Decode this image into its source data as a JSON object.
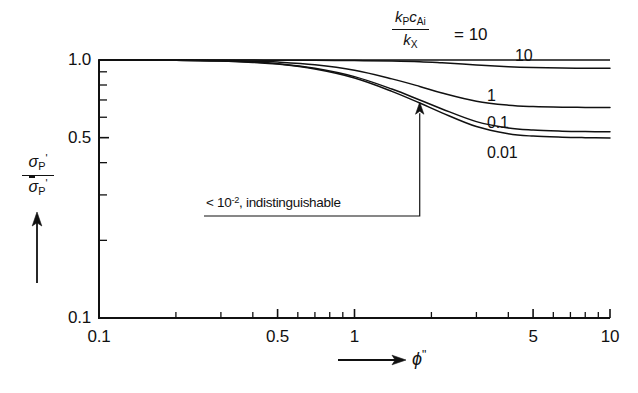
{
  "figure": {
    "background_color": "#ffffff",
    "line_color": "#111111"
  },
  "legend": {
    "numerator": "k",
    "numerator_sub_1": "P",
    "numerator_c": "c",
    "numerator_sub_2": "Ai",
    "denominator": "k",
    "denominator_sub": "X",
    "equals_value": "= 10"
  },
  "axis": {
    "y_label_numerator": "σ",
    "y_label_numerator_sub": "P",
    "y_label_denominator": "σ",
    "y_label_denominator_sub": "P",
    "y_prime": "'",
    "x_label": "ϕ",
    "x_label_prime": "\""
  },
  "annotation": {
    "text_lt": "<",
    "text_ten": "10",
    "text_exp": "-2",
    "text_rest": ", indistinguishable",
    "full_text": "< 10-2, indistinguishable"
  },
  "curve_labels": [
    {
      "label": "10",
      "x_px": 515,
      "y_px": 48
    },
    {
      "label": "1",
      "x_px": 487,
      "y_px": 88
    },
    {
      "label": "0.1",
      "x_px": 487,
      "y_px": 115
    },
    {
      "label": "0.01",
      "x_px": 487,
      "y_px": 145
    }
  ],
  "chart_data": {
    "type": "line",
    "title": "",
    "xlabel": "ϕ\"",
    "ylabel": "σ'_P / σ̄'_P",
    "xscale": "log",
    "yscale": "log",
    "xlim": [
      0.1,
      10
    ],
    "ylim": [
      0.1,
      1.0
    ],
    "grid": false,
    "legend_position": "inline-curve-labels",
    "legend_title": "k_P c_Ai / k_X",
    "xticks_major": [
      0.1,
      0.5,
      1,
      5,
      10
    ],
    "xtick_labels": [
      "0.1",
      "0.5",
      "1",
      "5",
      "10"
    ],
    "xticks_minor": [
      0.2,
      0.3,
      0.4,
      0.6,
      0.7,
      0.8,
      0.9,
      2,
      3,
      4,
      6,
      7,
      8,
      9
    ],
    "yticks_major": [
      0.1,
      0.5,
      1.0
    ],
    "ytick_labels": [
      "0.1",
      "0.5",
      "1.0"
    ],
    "yticks_minor": [
      0.2,
      0.3,
      0.4,
      0.6,
      0.7,
      0.8,
      0.9
    ],
    "series": [
      {
        "name": "10",
        "label": "10",
        "x": [
          0.1,
          0.15,
          0.2,
          0.3,
          0.4,
          0.5,
          0.7,
          1.0,
          1.4,
          1.8,
          2.2,
          3.0,
          4.0,
          5.0,
          6.5,
          8.0,
          10.0
        ],
        "values": [
          1.0,
          1.0,
          1.0,
          0.999,
          0.999,
          0.998,
          0.997,
          0.995,
          0.991,
          0.985,
          0.975,
          0.957,
          0.942,
          0.935,
          0.931,
          0.929,
          0.928
        ]
      },
      {
        "name": "1",
        "label": "1",
        "x": [
          0.1,
          0.15,
          0.2,
          0.3,
          0.4,
          0.5,
          0.7,
          1.0,
          1.4,
          1.8,
          2.2,
          3.0,
          4.0,
          5.0,
          6.5,
          8.0,
          10.0
        ],
        "values": [
          1.0,
          1.0,
          0.999,
          0.996,
          0.99,
          0.982,
          0.958,
          0.912,
          0.845,
          0.79,
          0.745,
          0.692,
          0.668,
          0.66,
          0.656,
          0.655,
          0.654
        ]
      },
      {
        "name": "0.1",
        "label": "0.1",
        "x": [
          0.1,
          0.15,
          0.2,
          0.3,
          0.4,
          0.5,
          0.7,
          1.0,
          1.4,
          1.8,
          2.2,
          3.0,
          4.0,
          5.0,
          6.5,
          8.0,
          10.0
        ],
        "values": [
          1.0,
          0.999,
          0.998,
          0.992,
          0.982,
          0.968,
          0.929,
          0.862,
          0.772,
          0.7,
          0.646,
          0.577,
          0.545,
          0.535,
          0.53,
          0.528,
          0.527
        ]
      },
      {
        "name": "0.01",
        "label": "0.01",
        "x": [
          0.1,
          0.15,
          0.2,
          0.3,
          0.4,
          0.5,
          0.7,
          1.0,
          1.4,
          1.8,
          2.2,
          3.0,
          4.0,
          5.0,
          6.5,
          8.0,
          10.0
        ],
        "values": [
          1.0,
          0.999,
          0.997,
          0.991,
          0.979,
          0.964,
          0.922,
          0.851,
          0.756,
          0.681,
          0.624,
          0.552,
          0.518,
          0.507,
          0.502,
          0.5,
          0.499
        ]
      }
    ],
    "annotations": [
      {
        "text": "< 10-2, indistinguishable",
        "points_to_x": 1.8,
        "points_to_y": 0.68
      }
    ]
  }
}
